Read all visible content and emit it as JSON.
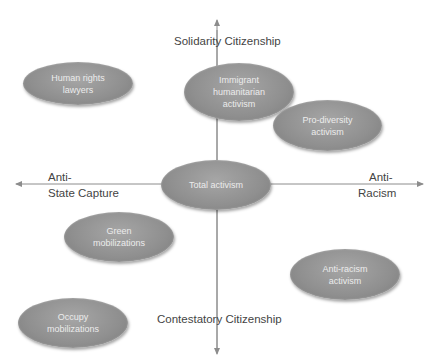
{
  "axes": {
    "top": "Solidarity Citizenship",
    "bottom": "Contestatory Citizenship",
    "left_line1": "Anti-",
    "left_line2": "State Capture",
    "right_line1": "Anti-",
    "right_line2": "Racism",
    "line_color": "#8c8c8c"
  },
  "nodes": [
    {
      "id": "human-rights-lawyers",
      "lines": [
        "Human rights",
        "lawyers"
      ]
    },
    {
      "id": "immigrant-humanitarian-activism",
      "lines": [
        "Immigrant",
        "humanitarian",
        "activism"
      ]
    },
    {
      "id": "pro-diversity-activism",
      "lines": [
        "Pro-diversity",
        "activism"
      ]
    },
    {
      "id": "total-activism",
      "lines": [
        "Total activism"
      ]
    },
    {
      "id": "green-mobilizations",
      "lines": [
        "Green",
        "mobilizations"
      ]
    },
    {
      "id": "anti-racism-activism",
      "lines": [
        "Anti-racism",
        "activism"
      ]
    },
    {
      "id": "occupy-mobilizations",
      "lines": [
        "Occupy",
        "mobilizations"
      ]
    }
  ],
  "colors": {
    "ellipse_fill": "#8f8f8f",
    "ellipse_text": "#ececec",
    "label_text": "#444444"
  }
}
